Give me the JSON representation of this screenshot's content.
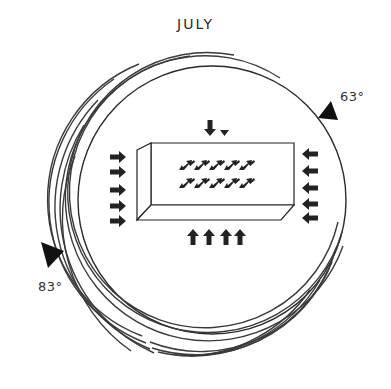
{
  "title": "JULY",
  "labels": {
    "upper_right_angle": "63°",
    "lower_left_angle": "83°"
  },
  "colors": {
    "ink": "#222222",
    "arc": "#3a3a3a",
    "background": "#ffffff"
  },
  "diagram": {
    "circle": {
      "cx": 212,
      "cy": 200,
      "r": 134
    },
    "concentric_arcs": 8,
    "block_arrows": {
      "left_side_right_pointing": 5,
      "right_side_left_pointing": 5,
      "bottom_up_pointing": 4,
      "top_down_pointing": 1,
      "top_small_triangle": 1,
      "interior_diagonal_rows": 2,
      "interior_diagonal_per_row": 5
    }
  }
}
